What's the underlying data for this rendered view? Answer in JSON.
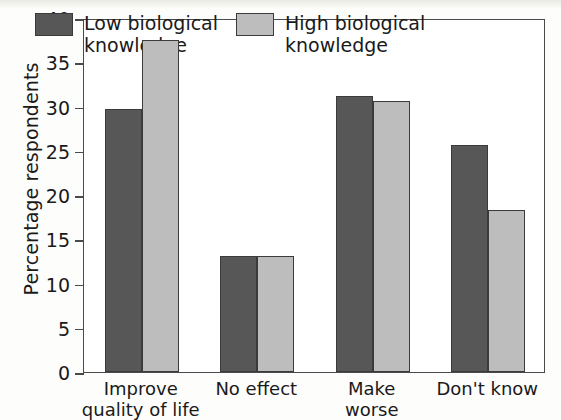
{
  "chart_data": {
    "type": "bar",
    "title": "",
    "subtitle": "",
    "xlabel": "",
    "ylabel": "Percentage respondents",
    "categories": [
      "Improve\nquality of life",
      "No effect",
      "Make\nworse",
      "Don't know"
    ],
    "series": [
      {
        "name": "Low biological\nknowledge",
        "color": "#575757",
        "values": [
          29.7,
          13.1,
          31.2,
          25.6
        ]
      },
      {
        "name": "High biological\nknowledge",
        "color": "#bdbdbd",
        "values": [
          37.5,
          13.1,
          30.6,
          18.3
        ]
      }
    ],
    "ylim": [
      0,
      40
    ],
    "yticks": [
      0,
      5,
      10,
      15,
      20,
      25,
      30,
      35,
      40
    ],
    "ytick_labels": [
      "0",
      "5",
      "10",
      "15",
      "20",
      "25",
      "30",
      "35",
      "40"
    ],
    "grid": false,
    "legend_position": "top-inside",
    "frame": "box"
  },
  "axis": {
    "y_title": "Percentage respondents"
  },
  "legend": {
    "items": [
      {
        "label": "Low biological\nknowledge",
        "swatch": "low"
      },
      {
        "label": "High biological\nknowledge",
        "swatch": "high"
      }
    ]
  }
}
